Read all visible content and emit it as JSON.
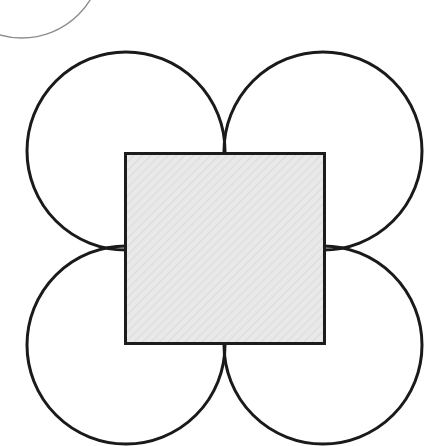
{
  "canvas": {
    "width": 443,
    "height": 446,
    "background_color": "#ffffff",
    "description": "Geometric figure: a hatched square with four equal circles centered on its corners, plus a faint cropped arc in the upper-left corner"
  },
  "figure": {
    "stroke_color": "#1a1a1a",
    "stroke_width": 3,
    "square": {
      "label": "shaded-square",
      "x": 125,
      "y": 153,
      "width": 199,
      "height": 190,
      "fill_color": "#e9e9e9",
      "hatch_color": "#dcdcdc",
      "border_color": "#1c1c1c",
      "border_width": 3
    },
    "circles": [
      {
        "label": "top-left-circle",
        "cx": 126,
        "cy": 151,
        "r": 99,
        "fill": "none",
        "stroke_color": "#1a1a1a",
        "stroke_width": 3
      },
      {
        "label": "top-right-circle",
        "cx": 323,
        "cy": 151,
        "r": 99,
        "fill": "none",
        "stroke_color": "#1a1a1a",
        "stroke_width": 3
      },
      {
        "label": "bottom-left-circle",
        "cx": 126,
        "cy": 345,
        "r": 99,
        "fill": "none",
        "stroke_color": "#1a1a1a",
        "stroke_width": 3
      },
      {
        "label": "bottom-right-circle",
        "cx": 323,
        "cy": 345,
        "r": 99,
        "fill": "none",
        "stroke_color": "#1a1a1a",
        "stroke_width": 3
      }
    ],
    "partial_arc": {
      "label": "cropped-arc-top-left",
      "cx": 22,
      "cy": -42,
      "r": 80,
      "stroke_color": "#8d8d8d",
      "stroke_width": 1.4,
      "fill": "none"
    }
  }
}
